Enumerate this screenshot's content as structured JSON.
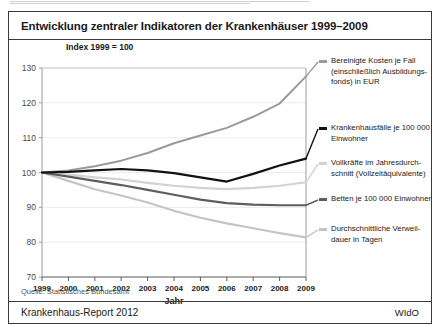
{
  "figure": {
    "title": "Entwicklung zentraler Indikatoren der Krankenhäuser 1999–2009",
    "axis_unit_note": "Index 1999 = 100",
    "source": "Quelle: Statistisches Bundesamt",
    "footer_left": "Krankenhaus-Report 2012",
    "footer_right": "WIdO"
  },
  "chart_data": {
    "type": "line",
    "title": "Entwicklung zentraler Indikatoren der Krankenhäuser 1999–2009",
    "xlabel": "Jahr",
    "ylabel": "Index 1999 = 100",
    "x": [
      1999,
      2000,
      2001,
      2002,
      2003,
      2004,
      2005,
      2006,
      2007,
      2008,
      2009
    ],
    "categories": [
      "1999",
      "2000",
      "2001",
      "2002",
      "2003",
      "2004",
      "2005",
      "2006",
      "2007",
      "2008",
      "2009"
    ],
    "ylim": [
      70,
      130
    ],
    "yticks": [
      70,
      80,
      90,
      100,
      110,
      120,
      130
    ],
    "xlim": [
      1999,
      2009
    ],
    "grid": true,
    "legend_position": "right",
    "series": [
      {
        "name": "Bereinigte Kosten je Fall (einschließlich Ausbildungsfonds) in EUR",
        "color": "#9a9a9a",
        "width": 2.0,
        "values": [
          100.0,
          100.6,
          101.8,
          103.4,
          105.6,
          108.4,
          110.6,
          112.8,
          116.0,
          119.8,
          127.6
        ]
      },
      {
        "name": "Krankenhausfälle je 100 000 Einwohner",
        "color": "#111111",
        "width": 2.2,
        "values": [
          100.0,
          100.2,
          100.6,
          101.0,
          100.6,
          99.8,
          98.6,
          97.4,
          99.6,
          102.0,
          104.0
        ]
      },
      {
        "name": "Vollkräfte im Jahresdurchschnitt (Vollzeitäquivalente)",
        "color": "#d2d2d2",
        "width": 2.2,
        "values": [
          100.0,
          99.4,
          98.6,
          98.0,
          97.0,
          96.2,
          95.6,
          95.2,
          95.6,
          96.2,
          97.2
        ]
      },
      {
        "name": "Betten je 100 000 Einwohner",
        "color": "#5e5e5e",
        "width": 2.2,
        "values": [
          100.0,
          98.8,
          97.6,
          96.4,
          95.0,
          93.6,
          92.2,
          91.2,
          90.8,
          90.6,
          90.6
        ]
      },
      {
        "name": "Durchschnittliche Verweildauer in Tagen",
        "color": "#c4c4c4",
        "width": 2.2,
        "values": [
          100.0,
          97.6,
          95.2,
          93.4,
          91.4,
          89.0,
          87.0,
          85.4,
          84.0,
          82.6,
          81.4
        ]
      }
    ]
  },
  "legend": [
    {
      "key": "cost-per-case",
      "line1": "Bereinigte Kosten je Fall",
      "line2": "(einschließlich Ausbildungs-",
      "line3": "fonds) in EUR",
      "color": "#9a9a9a"
    },
    {
      "key": "cases-per-100000",
      "line1": "Krankenhausfälle je 100 000",
      "line2": "Einwohner",
      "line3": "",
      "color": "#111111"
    },
    {
      "key": "full-time-staff",
      "line1": "Vollkräfte im Jahresdurch-",
      "line2": "schnitt (Vollzeitäquivalente)",
      "line3": "",
      "color": "#d2d2d2"
    },
    {
      "key": "beds-per-100000",
      "line1": "Betten je 100 000 Einwohner",
      "line2": "",
      "line3": "",
      "color": "#5e5e5e"
    },
    {
      "key": "average-stay",
      "line1": "Durchschnittliche Verweil-",
      "line2": "dauer in Tagen",
      "line3": "",
      "color": "#c4c4c4"
    }
  ]
}
